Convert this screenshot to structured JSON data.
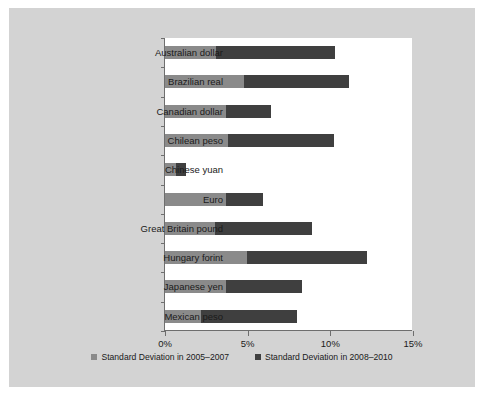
{
  "chart_data": {
    "type": "bar",
    "orientation": "horizontal",
    "stacked": true,
    "title": "",
    "xlabel": "",
    "ylabel": "",
    "xlim": [
      0,
      15
    ],
    "xticks": [
      "0%",
      "5%",
      "10%",
      "15%"
    ],
    "xtick_values": [
      0,
      5,
      10,
      15
    ],
    "grid": false,
    "legend_position": "bottom",
    "categories": [
      "Australian dollar",
      "Brazilian real",
      "Canadian dollar",
      "Chilean peso",
      "Chinese yuan",
      "Euro",
      "Great Britain pound",
      "Hungary forint",
      "Japanese yen",
      "Mexican peso"
    ],
    "series": [
      {
        "name": "Standard Deviation in 2005–2007",
        "color": "#8a8a8a",
        "values": [
          3.1,
          4.75,
          3.7,
          3.8,
          0.65,
          3.7,
          3.0,
          4.95,
          3.7,
          2.2
        ]
      },
      {
        "name": "Standard Deviation in 2008–2010",
        "color": "#3f3f3f",
        "values": [
          7.2,
          6.35,
          2.7,
          6.45,
          0.6,
          2.25,
          5.9,
          7.25,
          4.6,
          5.8
        ]
      }
    ],
    "totals": [
      10.3,
      11.1,
      6.4,
      10.25,
      1.25,
      5.95,
      8.9,
      12.2,
      8.3,
      8.0
    ]
  },
  "legend": [
    {
      "label": "Standard Deviation in 2005–2007",
      "color": "#8a8a8a"
    },
    {
      "label": "Standard Deviation in 2008–2010",
      "color": "#3f3f3f"
    }
  ]
}
